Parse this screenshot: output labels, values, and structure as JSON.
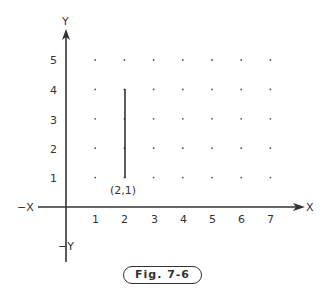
{
  "diagram": {
    "axes": {
      "x_label": "X",
      "neg_x_label": "−X",
      "y_label": "Y",
      "neg_y_label": "−Y",
      "x_ticks": [
        "1",
        "2",
        "3",
        "4",
        "5",
        "6",
        "7"
      ],
      "y_ticks": [
        "1",
        "2",
        "3",
        "4",
        "5"
      ]
    },
    "grid": "dot grid at integer points x=1..7, y=1..5",
    "segment": {
      "from": [
        2,
        1
      ],
      "to": [
        2,
        4
      ],
      "start_label": "(2,1)"
    },
    "caption": "Fig. 7-6"
  }
}
